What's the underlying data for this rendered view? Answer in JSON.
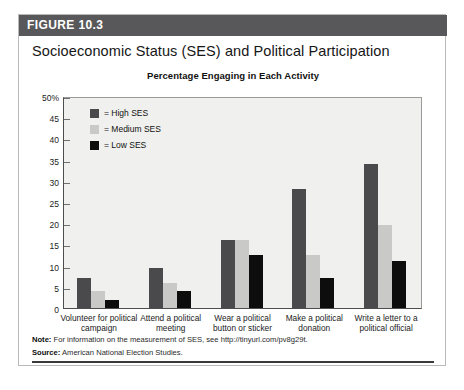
{
  "figure": {
    "band_label": "FIGURE 10.3",
    "title": "Socioeconomic Status (SES) and Political Participation",
    "subtitle": "Percentage Engaging in Each Activity",
    "note_label": "Note:",
    "note_text": "For information on the measurement of SES, see http://tinyurl.com/pv8g29t.",
    "source_label": "Source:",
    "source_text": "American National Election Studies."
  },
  "colors": {
    "band": "#58585a",
    "plot_background": "#f0f0ee",
    "high_ses": "#4a4a4c",
    "medium_ses": "#c9c9c7",
    "low_ses": "#0d0d0d",
    "axis": "#4d4d4d"
  },
  "chart_data": {
    "type": "bar",
    "title": "Percentage Engaging in Each Activity",
    "xlabel": "",
    "ylabel": "",
    "ylim": [
      0,
      50
    ],
    "ytick_labels": [
      "50%",
      "45",
      "40",
      "35",
      "30",
      "25",
      "20",
      "15",
      "10",
      "5",
      "0"
    ],
    "ytick_values": [
      50,
      45,
      40,
      35,
      30,
      25,
      20,
      15,
      10,
      5,
      0
    ],
    "grid": false,
    "legend_position": "top-left",
    "categories": [
      "Volunteer for political campaign",
      "Attend a political meeting",
      "Wear a political button or sticker",
      "Make a political donation",
      "Write a letter to a political official"
    ],
    "series": [
      {
        "name": "= High SES",
        "label": "High SES",
        "color": "#4a4a4c",
        "values": [
          7,
          9.5,
          16,
          28,
          34
        ]
      },
      {
        "name": "= Medium SES",
        "label": "Medium SES",
        "color": "#c9c9c7",
        "values": [
          4,
          6,
          16,
          12.5,
          19.5
        ]
      },
      {
        "name": "= Low SES",
        "label": "Low SES",
        "color": "#0d0d0d",
        "values": [
          2,
          4,
          12.5,
          7,
          11
        ]
      }
    ]
  }
}
